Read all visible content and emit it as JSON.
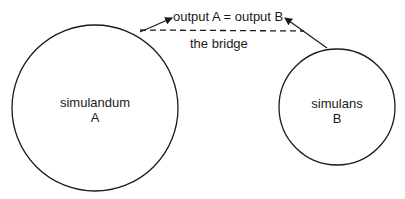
{
  "diagram": {
    "equation": "output A = output B",
    "bridge_label": "the bridge",
    "simulandum": {
      "name": "simulandum",
      "letter": "A"
    },
    "simulans": {
      "name": "simulans",
      "letter": "B"
    }
  },
  "colors": {
    "stroke": "#1a1a1a",
    "background": "#ffffff"
  }
}
